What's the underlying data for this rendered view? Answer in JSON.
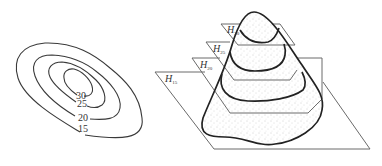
{
  "figure": {
    "left_panel": {
      "type": "contour-map",
      "contour_labels": [
        "30",
        "25",
        "20",
        "15"
      ]
    },
    "right_panel": {
      "type": "3d-mountain-with-horizontal-planes",
      "planes": [
        {
          "symbol": "H",
          "subscript": "30"
        },
        {
          "symbol": "H",
          "subscript": "25"
        },
        {
          "symbol": "H",
          "subscript": "20"
        },
        {
          "symbol": "H",
          "subscript": "15"
        }
      ]
    },
    "colors": {
      "line": "#222222",
      "plane": "#6a6a6a",
      "stipple": "#9a9a9a",
      "background": "#ffffff"
    }
  }
}
